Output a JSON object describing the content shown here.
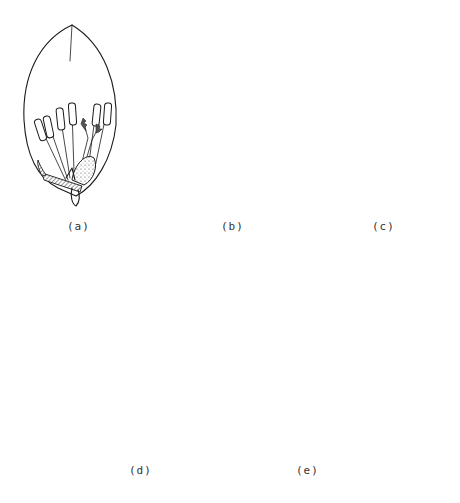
{
  "figure": {
    "panels": [
      {
        "id": "a",
        "label": "(a)",
        "stage": "closed floret, stamens inside"
      },
      {
        "id": "b",
        "label": "(b)",
        "stage": "filaments elongating"
      },
      {
        "id": "c",
        "label": "(c)",
        "stage": "anthers at apex, section line indicated"
      },
      {
        "id": "d",
        "label": "(d)",
        "stage": "floret open, anthers exserted"
      },
      {
        "id": "e",
        "label": "(e)",
        "stage": "floret closed after anthesis"
      }
    ],
    "annotations": {
      "section_arrow": "→",
      "section_line": "dashed horizontal line across panel (c)"
    }
  }
}
